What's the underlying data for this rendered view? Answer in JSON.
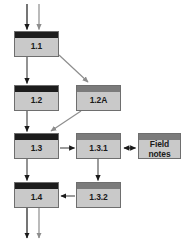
{
  "diagram": {
    "colors": {
      "box_fill": "#c9c9c9",
      "box_border": "#6e6e6e",
      "header_dark": "#1c1c1c",
      "header_gray": "#7b7b7b",
      "arrow_dark": "#1a1a1a",
      "arrow_gray": "#8d8d8d",
      "background": "#ffffff"
    },
    "nodes": [
      {
        "id": "n11",
        "label": "1.1",
        "header": "dark",
        "x": 14,
        "y": 31,
        "w": 45,
        "h": 26
      },
      {
        "id": "n12",
        "label": "1.2",
        "header": "dark",
        "x": 14,
        "y": 85,
        "w": 45,
        "h": 26
      },
      {
        "id": "n12a",
        "label": "1.2A",
        "header": "gray",
        "x": 76,
        "y": 85,
        "w": 45,
        "h": 26
      },
      {
        "id": "n13",
        "label": "1.3",
        "header": "dark",
        "x": 14,
        "y": 133,
        "w": 45,
        "h": 26
      },
      {
        "id": "n131",
        "label": "1.3.1",
        "header": "gray",
        "x": 76,
        "y": 133,
        "w": 45,
        "h": 26
      },
      {
        "id": "nfn",
        "label": "Field notes",
        "label_line1": "Field",
        "label_line2": "notes",
        "header": "gray",
        "x": 138,
        "y": 133,
        "w": 43,
        "h": 26
      },
      {
        "id": "n14",
        "label": "1.4",
        "header": "dark",
        "x": 14,
        "y": 182,
        "w": 45,
        "h": 26
      },
      {
        "id": "n132",
        "label": "1.3.2",
        "header": "gray",
        "x": 76,
        "y": 182,
        "w": 45,
        "h": 26
      }
    ],
    "connectors": [
      {
        "id": "in-dark",
        "name": "inlet-arrow-dark",
        "from": "top",
        "to": "n11",
        "style": "dark"
      },
      {
        "id": "in-gray",
        "name": "inlet-arrow-gray",
        "from": "top",
        "to": "n11",
        "style": "gray"
      },
      {
        "id": "c11-12",
        "name": "arrow-1-1-to-1-2",
        "from": "n11",
        "to": "n12",
        "style": "dark"
      },
      {
        "id": "c11-12a",
        "name": "arrow-1-1-to-1-2a",
        "from": "n11",
        "to": "n12a",
        "style": "gray"
      },
      {
        "id": "c12-13",
        "name": "arrow-1-2-to-1-3",
        "from": "n12",
        "to": "n13",
        "style": "dark"
      },
      {
        "id": "c12a-13",
        "name": "arrow-1-2a-to-1-3",
        "from": "n12a",
        "to": "n13",
        "style": "gray"
      },
      {
        "id": "c13-131",
        "name": "arrow-1-3-to-1-3-1",
        "from": "n13",
        "to": "n131",
        "style": "dark"
      },
      {
        "id": "c131-fn",
        "name": "arrow-1-3-1-field-notes",
        "from": "n131",
        "to": "nfn",
        "style": "dark",
        "bidirectional": true
      },
      {
        "id": "c131-132",
        "name": "arrow-1-3-1-to-1-3-2",
        "from": "n131",
        "to": "n132",
        "style": "dark"
      },
      {
        "id": "c132-14",
        "name": "arrow-1-3-2-to-1-4",
        "from": "n132",
        "to": "n14",
        "style": "dark"
      },
      {
        "id": "c13-14",
        "name": "arrow-1-3-to-1-4",
        "from": "n13",
        "to": "n14",
        "style": "dark"
      },
      {
        "id": "out-dark",
        "name": "outlet-arrow-dark",
        "from": "n14",
        "to": "bottom",
        "style": "dark"
      },
      {
        "id": "out-gray",
        "name": "outlet-arrow-gray",
        "from": "n14",
        "to": "bottom",
        "style": "gray"
      }
    ]
  }
}
